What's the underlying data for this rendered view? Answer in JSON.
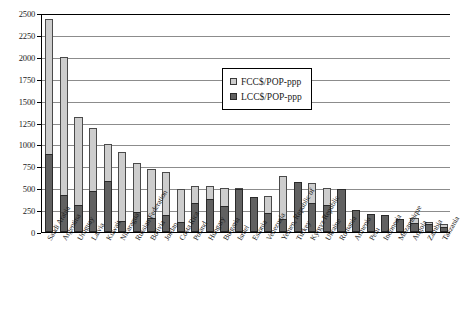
{
  "chart_data": {
    "type": "bar",
    "stacked": true,
    "title": "",
    "xlabel": "",
    "ylabel": "",
    "ylim": [
      0,
      2500
    ],
    "ytick_step": 250,
    "yticks": [
      "2500",
      "2250",
      "2000",
      "1750",
      "1500",
      "1250",
      "1000",
      "750",
      "500",
      "250",
      "0"
    ],
    "grid": true,
    "legend_position": "upper-center",
    "legend": [
      "FCC$/POP-ppp",
      "LCC$/POP-ppp"
    ],
    "colors": {
      "fcc": "#cdcdcd",
      "lcc": "#616161",
      "axis": "#000000",
      "grid": "#8c8c8c"
    },
    "categories": [
      "Saudi Arabia",
      "Argentina",
      "Uruguay",
      "Latvia",
      "Kuwait",
      "Nicaragua",
      "Russian Federation",
      "Bolivia",
      "Jordan",
      "Costa Rica",
      "Poland",
      "Hungary",
      "Bulgaria",
      "Israel",
      "Estonia",
      "Venezuela",
      "Yemen, Republic of",
      "Turkey",
      "Kyrgyz Republic",
      "Ukraine",
      "Romania",
      "Armenia",
      "Peru",
      "Indonesia",
      "Mozambique",
      "Angola",
      "Zambia",
      "Tanzania"
    ],
    "series": [
      {
        "name": "LCC$/POP-ppp",
        "values": [
          890,
          420,
          305,
          465,
          580,
          125,
          230,
          160,
          190,
          120,
          330,
          380,
          300,
          490,
          400,
          215,
          150,
          575,
          335,
          310,
          495,
          250,
          200,
          195,
          145,
          105,
          95,
          60
        ]
      },
      {
        "name": "FCC$/POP-ppp",
        "values": [
          1540,
          1580,
          1005,
          725,
          420,
          790,
          560,
          560,
          495,
          375,
          190,
          140,
          200,
          10,
          0,
          195,
          490,
          0,
          225,
          190,
          0,
          0,
          0,
          0,
          0,
          55,
          15,
          30
        ]
      }
    ],
    "totals": [
      2430,
      2000,
      1310,
      1190,
      1000,
      915,
      790,
      720,
      685,
      495,
      520,
      520,
      500,
      500,
      400,
      410,
      640,
      575,
      560,
      500,
      495,
      250,
      200,
      195,
      145,
      160,
      110,
      90
    ]
  }
}
